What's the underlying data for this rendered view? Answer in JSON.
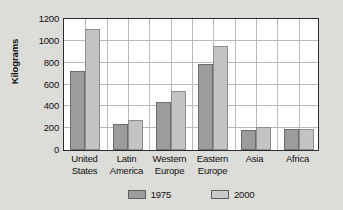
{
  "chart_data": {
    "type": "bar",
    "title": "",
    "subtitle": "",
    "xlabel": "",
    "ylabel": "Kilograms",
    "ylim": [
      0,
      1200
    ],
    "ytick_values": [
      1200,
      1000,
      800,
      600,
      400,
      200,
      0
    ],
    "ytick_labels": [
      "1200",
      "1000",
      "800",
      "600",
      "400",
      "200",
      "0"
    ],
    "grid": "both",
    "legend_position": "bottom-center",
    "categories": [
      "United States",
      "Latin America",
      "Western Europe",
      "Eastern Europe",
      "Asia",
      "Africa"
    ],
    "category_lines": [
      [
        "United",
        "States"
      ],
      [
        "Latin",
        "America"
      ],
      [
        "Western",
        "Europe"
      ],
      [
        "Eastern",
        "Europe"
      ],
      [
        "Asia",
        ""
      ],
      [
        "Africa",
        ""
      ]
    ],
    "series": [
      {
        "name": "1975",
        "color": "#9c9c9c",
        "values": [
          720,
          240,
          440,
          790,
          185,
          190
        ]
      },
      {
        "name": "2000",
        "color": "#c3c3c3",
        "values": [
          1110,
          275,
          545,
          950,
          210,
          190
        ]
      }
    ]
  },
  "legend": {
    "items": [
      {
        "label": "1975",
        "swatch": "legend-swatch-1975"
      },
      {
        "label": "2000",
        "swatch": "legend-swatch-2000"
      }
    ]
  },
  "colors": {
    "page_background": "#dcdcd8",
    "plot_background": "#ffffff",
    "frame": "#2b2b2b",
    "gridline": "#b9b9b9",
    "series_1975": "#9c9c9c",
    "series_2000": "#c3c3c3",
    "text": "#111111"
  }
}
